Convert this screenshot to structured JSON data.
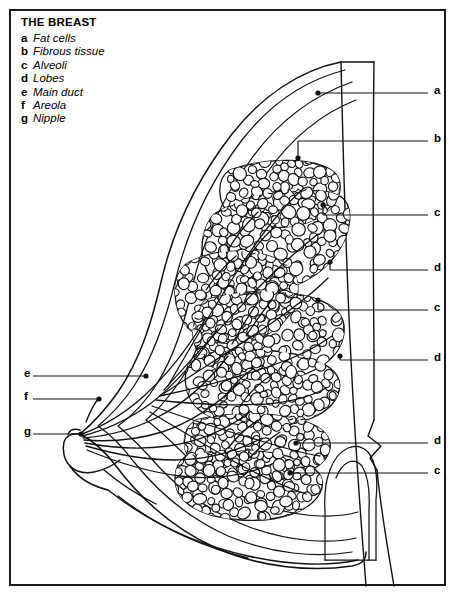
{
  "legend": {
    "title": "THE BREAST",
    "items": [
      {
        "key": "a",
        "label": "Fat cells"
      },
      {
        "key": "b",
        "label": "Fibrous tissue"
      },
      {
        "key": "c",
        "label": "Alveoli"
      },
      {
        "key": "d",
        "label": "Lobes"
      },
      {
        "key": "e",
        "label": "Main duct"
      },
      {
        "key": "f",
        "label": "Areola"
      },
      {
        "key": "g",
        "label": "Nipple"
      }
    ]
  },
  "callouts": {
    "right": [
      {
        "key": "a",
        "x": 434,
        "y": 85,
        "line_x1": 318,
        "line_x2": 428,
        "line_y": 93,
        "dot_x": 318,
        "dot_y": 93
      },
      {
        "key": "b",
        "x": 434,
        "y": 133,
        "line_x1": 298,
        "line_x2": 428,
        "line_y": 141,
        "dot_x": 298,
        "dot_y": 158
      },
      {
        "key": "c",
        "x": 434,
        "y": 207,
        "line_x1": 323,
        "line_x2": 428,
        "line_y": 215,
        "dot_x": 323,
        "dot_y": 205
      },
      {
        "key": "d",
        "x": 434,
        "y": 262,
        "line_x1": 330,
        "line_x2": 428,
        "line_y": 270,
        "dot_x": 330,
        "dot_y": 262
      },
      {
        "key": "c",
        "x": 434,
        "y": 302,
        "line_x1": 318,
        "line_x2": 428,
        "line_y": 310,
        "dot_x": 318,
        "dot_y": 300
      },
      {
        "key": "d",
        "x": 434,
        "y": 352,
        "line_x1": 340,
        "line_x2": 428,
        "line_y": 360,
        "dot_x": 340,
        "dot_y": 356
      },
      {
        "key": "d",
        "x": 434,
        "y": 435,
        "line_x1": 296,
        "line_x2": 428,
        "line_y": 443,
        "dot_x": 296,
        "dot_y": 443
      },
      {
        "key": "c",
        "x": 434,
        "y": 465,
        "line_x1": 290,
        "line_x2": 428,
        "line_y": 473,
        "dot_x": 290,
        "dot_y": 473
      }
    ],
    "left": [
      {
        "key": "e",
        "x": 24,
        "y": 368,
        "line_x1": 33,
        "line_x2": 146,
        "line_y": 376,
        "dot_x": 146,
        "dot_y": 376
      },
      {
        "key": "f",
        "x": 24,
        "y": 391,
        "line_x1": 33,
        "line_x2": 99,
        "line_y": 399,
        "dot_x": 99,
        "dot_y": 399
      },
      {
        "key": "g",
        "x": 24,
        "y": 426,
        "line_x1": 33,
        "line_x2": 81,
        "line_y": 434,
        "dot_x": 81,
        "dot_y": 434
      }
    ]
  },
  "colors": {
    "ink": "#111111",
    "frame": "#1a1a1a",
    "paper": "#ffffff"
  },
  "diagram": {
    "name": "breast-cross-section",
    "orientation": "sagittal-section-facing-left"
  }
}
